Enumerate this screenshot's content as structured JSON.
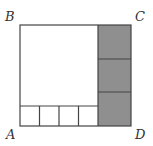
{
  "diagram": {
    "labels": {
      "A": "A",
      "B": "B",
      "C": "C",
      "D": "D"
    },
    "colors": {
      "stroke": "#444444",
      "shade": "#8f8f8f",
      "background": "#ffffff"
    },
    "structure": {
      "outer_rectangle": "ABCD",
      "large_square": "white, top-left",
      "bottom_strip_cells": 4,
      "right_column_shaded_cells": 3
    }
  }
}
